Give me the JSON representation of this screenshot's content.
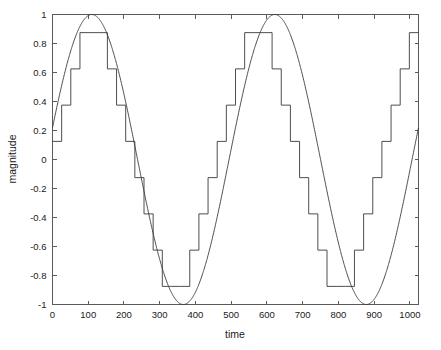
{
  "chart_data": {
    "type": "line",
    "title": "",
    "xlabel": "time",
    "ylabel": "magnitude",
    "xlim": [
      0,
      1024
    ],
    "ylim": [
      -1,
      1
    ],
    "grid": false,
    "legend": null,
    "xticks": [
      0,
      100,
      200,
      300,
      400,
      500,
      600,
      700,
      800,
      900,
      1000
    ],
    "xticklabels": [
      "0",
      "100",
      "200",
      "300",
      "400",
      "500",
      "600",
      "700",
      "800",
      "900",
      "1000"
    ],
    "yticks": [
      1,
      0.8,
      0.6,
      0.4,
      0.2,
      0,
      -0.2,
      -0.4,
      -0.6,
      -0.8,
      -1
    ],
    "yticklabels": [
      "1",
      "0.8",
      "0.6",
      "0.4",
      "0.2",
      "0",
      "-0.2",
      "-0.4",
      "-0.6",
      "-0.8",
      "-1"
    ],
    "series": [
      {
        "name": "continuous sine",
        "style": "smooth-curve",
        "color": "#3a3a3a",
        "description": "sin(2*pi*2*t/1024) with phase offset, 2 full periods over 1024 samples",
        "amplitude": 1.0,
        "periods": 2,
        "phase_offset_samples": 18,
        "npoints": 1025
      },
      {
        "name": "quantized staircase",
        "style": "step-post",
        "color": "#3a3a3a",
        "description": "sample-and-hold of the sine, quantized to 8 uniform levels (3-bit)",
        "sample_interval": 25.6,
        "quantizer_levels": [
          0.875,
          0.625,
          0.375,
          0.125,
          -0.125,
          -0.375,
          -0.625,
          -0.875
        ],
        "quantizer_step": 0.25,
        "nsamples": 40
      }
    ],
    "x": [
      0,
      25.6,
      51.2,
      76.8,
      102.4,
      128,
      153.6,
      179.2,
      204.8,
      230.4,
      256,
      281.6,
      307.2,
      332.8,
      358.4,
      384,
      409.6,
      435.2,
      460.8,
      486.4,
      512,
      537.6,
      563.2,
      588.8,
      614.4,
      640,
      665.6,
      691.2,
      716.8,
      742.4,
      768,
      793.6,
      819.2,
      844.8,
      870.4,
      896,
      921.6,
      947.2,
      972.8,
      998.4,
      1024
    ],
    "staircase_values": [
      0.125,
      0.375,
      0.625,
      0.875,
      0.875,
      0.875,
      0.625,
      0.375,
      0.125,
      -0.125,
      -0.375,
      -0.625,
      -0.875,
      -0.875,
      -0.875,
      -0.625,
      -0.375,
      -0.125,
      0.125,
      0.375,
      0.625,
      0.875,
      0.875,
      0.875,
      0.625,
      0.375,
      0.125,
      -0.125,
      -0.375,
      -0.625,
      -0.875,
      -0.875,
      -0.875,
      -0.625,
      -0.375,
      -0.125,
      0.125,
      0.375,
      0.625,
      0.875,
      0.875
    ]
  },
  "axes": {
    "xlabel": "time",
    "ylabel": "magnitude"
  }
}
